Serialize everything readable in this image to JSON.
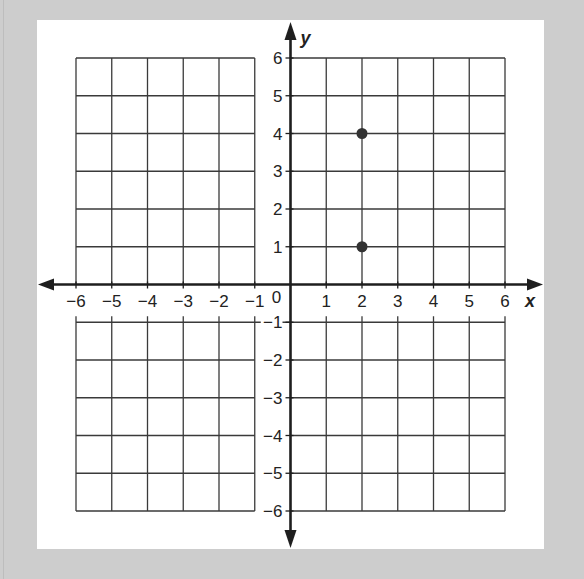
{
  "chart_data": {
    "type": "scatter",
    "title": "",
    "xlabel": "x",
    "ylabel": "y",
    "xlim": [
      -6,
      6
    ],
    "ylim": [
      -6,
      6
    ],
    "grid": true,
    "x_ticks": [
      "-6",
      "-5",
      "-4",
      "-3",
      "-2",
      "-1",
      "1",
      "2",
      "3",
      "4",
      "5",
      "6"
    ],
    "y_ticks": [
      "6",
      "5",
      "4",
      "3",
      "2",
      "1",
      "-1",
      "-2",
      "-3",
      "-4",
      "-5",
      "-6"
    ],
    "origin_label": "0",
    "points": [
      {
        "x": 2,
        "y": 4
      },
      {
        "x": 2,
        "y": 1
      }
    ]
  },
  "colors": {
    "background": "#cdcdcd",
    "panel": "#ffffff",
    "ink": "#1e1e1e",
    "point": "#333333"
  }
}
